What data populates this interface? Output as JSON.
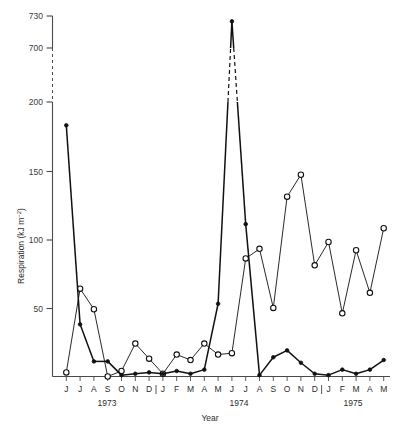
{
  "figure": {
    "y_axis_title": "Respiration (kJ m",
    "y_axis_title_sup": "−2",
    "y_axis_title_tail": ")",
    "x_axis_title": "Year"
  },
  "chart_data": {
    "type": "line",
    "title": "",
    "xlabel": "Year",
    "ylabel": "Respiration (kJ m−2)",
    "ylim": [
      0,
      730
    ],
    "grid": false,
    "legend": "none",
    "axis_break": {
      "below": 200,
      "above": 700,
      "style": "dashed"
    },
    "ytick_labels": [
      "50",
      "100",
      "150",
      "200",
      "700",
      "730"
    ],
    "ytick_values": [
      50,
      100,
      150,
      200,
      700,
      730
    ],
    "month_labels": [
      "J",
      "J",
      "A",
      "S",
      "O",
      "N",
      "D",
      "J",
      "F",
      "M",
      "A",
      "M",
      "J",
      "J",
      "A",
      "S",
      "O",
      "N",
      "D",
      "J",
      "F",
      "M",
      "A",
      "M"
    ],
    "year_labels": [
      "1973",
      "1974",
      "1975"
    ],
    "x": [
      "1973-06",
      "1973-07",
      "1973-08",
      "1973-09",
      "1973-10",
      "1973-11",
      "1973-12",
      "1974-01",
      "1974-02",
      "1974-03",
      "1974-04",
      "1974-05",
      "1974-06",
      "1974-07",
      "1974-08",
      "1974-09",
      "1974-10",
      "1974-11",
      "1974-12",
      "1975-01",
      "1975-02",
      "1975-03",
      "1975-04",
      "1975-05"
    ],
    "series": [
      {
        "name": "closed-circles",
        "marker": "filled-circle",
        "values": [
          183,
          38,
          11,
          11,
          1,
          2,
          3,
          2,
          4,
          2,
          5,
          53,
          725,
          111,
          1,
          14,
          19,
          10,
          2,
          1,
          5,
          2,
          5,
          12
        ]
      },
      {
        "name": "open-circles",
        "marker": "open-circle",
        "values": [
          3,
          64,
          49,
          0,
          4,
          24,
          13,
          2,
          16,
          12,
          24,
          16,
          17,
          86,
          93,
          50,
          131,
          147,
          81,
          98,
          46,
          92,
          61,
          108
        ]
      }
    ]
  }
}
